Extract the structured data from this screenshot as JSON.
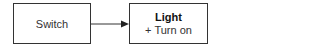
{
  "nodes": [
    {
      "id": "switch",
      "label": "Switch"
    },
    {
      "id": "light",
      "title": "Light",
      "members": [
        "+ Turn on"
      ]
    }
  ],
  "edges": [
    {
      "from": "switch",
      "to": "light",
      "type": "directed-arrow"
    }
  ],
  "colors": {
    "stroke": "#333333",
    "background": "#ffffff"
  }
}
